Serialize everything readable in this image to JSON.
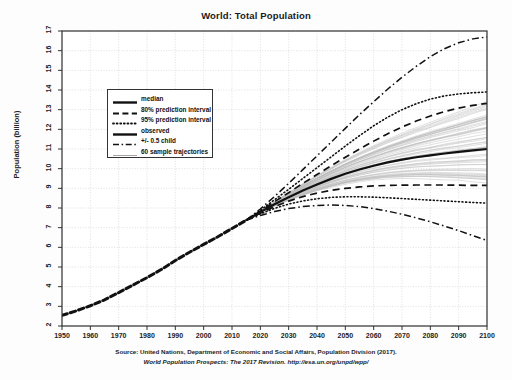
{
  "chart_data": {
    "type": "line",
    "title": "World: Total Population",
    "xlabel": "",
    "ylabel": "Population (billion)",
    "xlim": [
      1950,
      2100
    ],
    "ylim": [
      2,
      17
    ],
    "grid": true,
    "legend_position": "upper left inside",
    "xticks": [
      1950,
      1960,
      1970,
      1980,
      1990,
      2000,
      2010,
      2020,
      2030,
      2040,
      2050,
      2060,
      2070,
      2080,
      2090,
      2100
    ],
    "yticks": [
      2,
      3,
      4,
      5,
      6,
      7,
      8,
      9,
      10,
      11,
      12,
      13,
      14,
      15,
      16,
      17
    ],
    "x_observed": [
      1950,
      1955,
      1960,
      1965,
      1970,
      1975,
      1980,
      1985,
      1990,
      1995,
      2000,
      2005,
      2010,
      2015
    ],
    "x_projection": [
      2015,
      2020,
      2025,
      2030,
      2035,
      2040,
      2045,
      2050,
      2055,
      2060,
      2065,
      2070,
      2075,
      2080,
      2085,
      2090,
      2095,
      2100
    ],
    "series": [
      {
        "name": "observed",
        "style": "thick-dashed-dotted",
        "x": [
          1950,
          1955,
          1960,
          1965,
          1970,
          1975,
          1980,
          1985,
          1990,
          1995,
          2000,
          2005,
          2010,
          2015
        ],
        "values": [
          2.54,
          2.77,
          3.03,
          3.33,
          3.7,
          4.08,
          4.46,
          4.87,
          5.33,
          5.75,
          6.15,
          6.54,
          6.96,
          7.38
        ]
      },
      {
        "name": "median",
        "style": "thick-solid",
        "x": [
          2015,
          2020,
          2025,
          2030,
          2035,
          2040,
          2045,
          2050,
          2055,
          2060,
          2065,
          2070,
          2075,
          2080,
          2085,
          2090,
          2095,
          2100
        ],
        "values": [
          7.38,
          7.79,
          8.19,
          8.55,
          8.89,
          9.2,
          9.48,
          9.74,
          9.96,
          10.15,
          10.32,
          10.46,
          10.58,
          10.68,
          10.77,
          10.85,
          10.93,
          11.0
        ]
      },
      {
        "name": "80% prediction interval",
        "style": "dashed",
        "x": [
          2015,
          2020,
          2025,
          2030,
          2035,
          2040,
          2045,
          2050,
          2055,
          2060,
          2065,
          2070,
          2075,
          2080,
          2085,
          2090,
          2095,
          2100
        ],
        "upper": [
          7.38,
          7.84,
          8.32,
          8.78,
          9.25,
          9.7,
          10.15,
          10.58,
          11.0,
          11.4,
          11.78,
          12.12,
          12.42,
          12.68,
          12.9,
          13.08,
          13.22,
          13.32
        ],
        "lower": [
          7.38,
          7.74,
          8.07,
          8.35,
          8.58,
          8.76,
          8.9,
          9.0,
          9.07,
          9.12,
          9.15,
          9.16,
          9.17,
          9.17,
          9.17,
          9.16,
          9.15,
          9.15
        ]
      },
      {
        "name": "95% prediction interval",
        "style": "dotted",
        "x": [
          2015,
          2020,
          2025,
          2030,
          2035,
          2040,
          2045,
          2050,
          2055,
          2060,
          2065,
          2070,
          2075,
          2080,
          2085,
          2090,
          2095,
          2100
        ],
        "upper": [
          7.38,
          7.88,
          8.42,
          8.95,
          9.5,
          10.05,
          10.6,
          11.15,
          11.68,
          12.18,
          12.62,
          13.0,
          13.3,
          13.54,
          13.7,
          13.8,
          13.86,
          13.9
        ],
        "lower": [
          7.38,
          7.7,
          7.98,
          8.2,
          8.36,
          8.47,
          8.54,
          8.57,
          8.57,
          8.55,
          8.52,
          8.48,
          8.44,
          8.4,
          8.36,
          8.32,
          8.28,
          8.25
        ]
      },
      {
        "name": "+/- 0.5 child",
        "style": "dash-dot",
        "x": [
          2015,
          2020,
          2025,
          2030,
          2035,
          2040,
          2045,
          2050,
          2055,
          2060,
          2065,
          2070,
          2075,
          2080,
          2085,
          2090,
          2095,
          2100
        ],
        "upper": [
          7.38,
          7.95,
          8.58,
          9.25,
          9.95,
          10.65,
          11.35,
          12.05,
          12.75,
          13.4,
          14.05,
          14.65,
          15.2,
          15.7,
          16.1,
          16.4,
          16.6,
          16.7
        ],
        "lower": [
          7.38,
          7.62,
          7.82,
          7.97,
          8.07,
          8.13,
          8.15,
          8.13,
          8.07,
          7.97,
          7.84,
          7.68,
          7.5,
          7.3,
          7.08,
          6.85,
          6.6,
          6.35
        ]
      },
      {
        "name": "60 sample trajectories",
        "style": "thin-gray",
        "count": 60,
        "spread_at_2100": [
          9.2,
          13.6
        ]
      }
    ],
    "legend": [
      {
        "label": "median",
        "key": "solid-thick"
      },
      {
        "label": "80% prediction interval",
        "key": "dashed"
      },
      {
        "label": "95% prediction interval",
        "key": "dotted"
      },
      {
        "label": "observed",
        "key": "solid-thick"
      },
      {
        "label": "+/- 0.5 child",
        "key": "dash-dot"
      },
      {
        "label": "60 sample trajectories",
        "key": "thin-gray"
      }
    ]
  },
  "caption": {
    "line1": "Source: United Nations, Department of Economic and Social Affairs, Population Division (2017).",
    "line2": "World Population Prospects: The 2017 Revision. http://esa.un.org/unpd/wpp/"
  },
  "colors": {
    "ink": "#111111",
    "grid": "#cfcfcf",
    "axis": "#333333",
    "trajectory": "#bdbdbd",
    "background": "#fdfdfd"
  }
}
